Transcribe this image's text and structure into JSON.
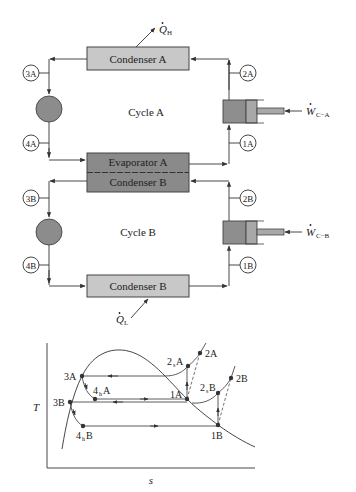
{
  "schematic": {
    "condenser_a": "Condenser A",
    "evaporator_a": "Evaporator A",
    "condenser_b_upper": "Condenser B",
    "condenser_b_lower": "Condenser B",
    "cycle_a": "Cycle A",
    "cycle_b": "Cycle B",
    "heat_out": {
      "symbol": "Q",
      "sub": "H"
    },
    "heat_in": {
      "symbol": "Q",
      "sub": "L"
    },
    "work_a": {
      "symbol": "W",
      "sub": "C−A"
    },
    "work_b": {
      "symbol": "W",
      "sub": "C−B"
    },
    "states": {
      "s3A": "3A",
      "s2A": "2A",
      "s4A": "4A",
      "s1A": "1A",
      "s3B": "3B",
      "s2B": "2B",
      "s4B": "4B",
      "s1B": "1B"
    },
    "colors": {
      "light_box": "#c8c8c8",
      "dark_box": "#8a8a8a",
      "valve": "#8c8c8c",
      "compressor": "#8e8e8e",
      "line": "#333333"
    }
  },
  "ts_diagram": {
    "ylabel": "T",
    "xlabel": "s",
    "points": {
      "p3A": "3A",
      "p3B": "3B",
      "p4hA_main": "4",
      "p4hA_sub": "h",
      "p4hA_suffix": "A",
      "p4hB_main": "4",
      "p4hB_sub": "h",
      "p4hB_suffix": "B",
      "p1A": "1A",
      "p1B": "1B",
      "p2sA_main": "2",
      "p2sA_sub": "s",
      "p2sA_suffix": "A",
      "p2sB_main": "2",
      "p2sB_sub": "s",
      "p2sB_suffix": "B",
      "p2A": "2A",
      "p2B": "2B"
    }
  }
}
